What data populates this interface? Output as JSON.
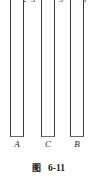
{
  "figure": {
    "caption_label": "图",
    "caption_number": "6-11",
    "background_color": "#ffffff",
    "line_color": "#3a3a3a",
    "text_color": "#1e1e1e"
  },
  "top_numbers": [
    {
      "text": "1",
      "x": 7
    },
    {
      "text": "2",
      "x": 20
    },
    {
      "text": "3",
      "x": 29
    },
    {
      "text": "4",
      "x": 48
    },
    {
      "text": "5",
      "x": 57
    },
    {
      "text": "6",
      "x": 80
    }
  ],
  "columns": [
    {
      "label": "A",
      "x": 10,
      "width": 14,
      "height": 143,
      "label_x": 11
    },
    {
      "label": "C",
      "x": 41,
      "width": 14,
      "height": 143,
      "label_x": 42
    },
    {
      "label": "B",
      "x": 70,
      "width": 14,
      "height": 143,
      "label_x": 71
    }
  ]
}
